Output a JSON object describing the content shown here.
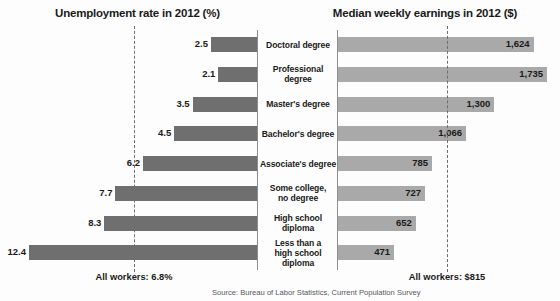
{
  "chart_data": {
    "type": "bar",
    "layout": "back-to-back horizontal bar (tornado) chart",
    "categories": [
      "Doctoral degree",
      "Professional degree",
      "Master's degree",
      "Bachelor's degree",
      "Associate's degree",
      "Some college,\nno degree",
      "High school diploma",
      "Less than a\nhigh school diploma"
    ],
    "series": [
      {
        "name": "Unemployment rate in 2012 (%)",
        "side": "left",
        "color": "#6f6f6f",
        "unit": "%",
        "values": [
          2.5,
          2.1,
          3.5,
          4.5,
          6.2,
          7.7,
          8.3,
          12.4
        ],
        "value_labels": [
          "2.5",
          "2.1",
          "3.5",
          "4.5",
          "6.2",
          "7.7",
          "8.3",
          "12.4"
        ],
        "axis_max": 12.4,
        "reference_line": {
          "value": 6.8,
          "label": "All workers: 6.8%"
        }
      },
      {
        "name": "Median weekly earnings in 2012 ($)",
        "side": "right",
        "color": "#a9a9a9",
        "unit": "$",
        "values": [
          1624,
          1735,
          1300,
          1066,
          785,
          727,
          652,
          471
        ],
        "value_labels": [
          "1,624",
          "1,735",
          "1,300",
          "1,066",
          "785",
          "727",
          "652",
          "471"
        ],
        "axis_max": 1735,
        "reference_line": {
          "value": 815,
          "label": "All workers: $815"
        }
      }
    ],
    "grid": false,
    "legend": "none",
    "source": "Source: Bureau of Labor Statistics, Current Population Survey"
  },
  "titles": {
    "left": "Unemployment rate in 2012 (%)",
    "right": "Median weekly earnings in 2012 ($)"
  },
  "averages": {
    "left_label": "All workers: 6.8%",
    "right_label": "All workers: $815"
  },
  "footer": {
    "source": "Source: Bureau of Labor Statistics, Current Population Survey"
  },
  "rows": [
    {
      "category": "Doctoral degree",
      "line1": "Doctoral degree",
      "line2": "",
      "unemployment": "2.5",
      "earnings": "1,624"
    },
    {
      "category": "Professional degree",
      "line1": "Professional degree",
      "line2": "",
      "unemployment": "2.1",
      "earnings": "1,735"
    },
    {
      "category": "Master's degree",
      "line1": "Master's degree",
      "line2": "",
      "unemployment": "3.5",
      "earnings": "1,300"
    },
    {
      "category": "Bachelor's degree",
      "line1": "Bachelor's degree",
      "line2": "",
      "unemployment": "4.5",
      "earnings": "1,066"
    },
    {
      "category": "Associate's degree",
      "line1": "Associate's degree",
      "line2": "",
      "unemployment": "6.2",
      "earnings": "785"
    },
    {
      "category": "Some college, no degree",
      "line1": "Some college,",
      "line2": "no degree",
      "unemployment": "7.7",
      "earnings": "727"
    },
    {
      "category": "High school diploma",
      "line1": "High school diploma",
      "line2": "",
      "unemployment": "8.3",
      "earnings": "652"
    },
    {
      "category": "Less than a high school diploma",
      "line1": "Less than a",
      "line2": "high school diploma",
      "unemployment": "12.4",
      "earnings": "471"
    }
  ]
}
